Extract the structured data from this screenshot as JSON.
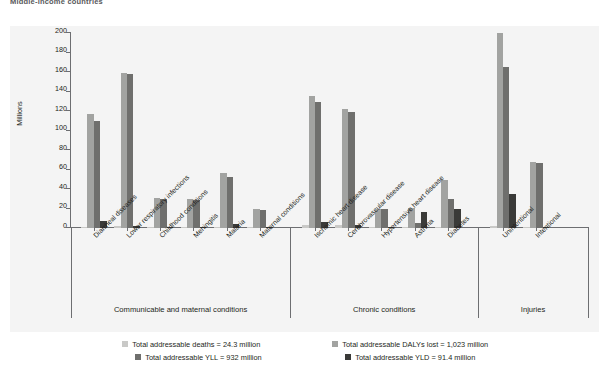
{
  "title": "Middle-income countries",
  "axis": {
    "y_label": "Millions",
    "y_ticks": [
      "200",
      "180",
      "160",
      "140",
      "120",
      "100",
      "80",
      "60",
      "40",
      "20",
      "0"
    ]
  },
  "legend": {
    "items": [
      {
        "label": "Total addressable deaths = 24.3 million",
        "color": "#c9c9c7",
        "key": "deaths"
      },
      {
        "label": "Total addressable DALYs lost = 1,023 million",
        "color": "#a2a3a1",
        "key": "dalys"
      },
      {
        "label": "Total addressable YLL = 932 million",
        "color": "#6f6f6d",
        "key": "yll"
      },
      {
        "label": "Total addressable YLD = 91.4 million",
        "color": "#3a3a38",
        "key": "yld"
      }
    ]
  },
  "groups": [
    {
      "name": "Communicable and maternal conditions"
    },
    {
      "name": "Chronic conditions"
    },
    {
      "name": "Injuries"
    }
  ],
  "chart_data": {
    "type": "bar",
    "title": "Middle-income countries",
    "xlabel": "",
    "ylabel": "Millions",
    "ylim": [
      0,
      200
    ],
    "ytick_step": 20,
    "grid": false,
    "legend_position": "bottom",
    "categories": [
      "Diarrheal diseases",
      "Lower respiratory infections",
      "Childhood conditions",
      "Meningitis",
      "Malaria",
      "Maternal conditions",
      "Ischemic heart disease",
      "Cerebrovascular disease",
      "Hypertensive heart disease",
      "Asthma",
      "Diabetes",
      "Unintentional",
      "Intentional"
    ],
    "category_groups": [
      "Communicable and maternal conditions",
      "Communicable and maternal conditions",
      "Communicable and maternal conditions",
      "Communicable and maternal conditions",
      "Communicable and maternal conditions",
      "Communicable and maternal conditions",
      "Chronic conditions",
      "Chronic conditions",
      "Chronic conditions",
      "Chronic conditions",
      "Chronic conditions",
      "Injuries",
      "Injuries"
    ],
    "series": [
      {
        "name": "Total addressable deaths",
        "color": "#c9c9c7",
        "values": [
          1.5,
          1.8,
          0.6,
          0.5,
          0.6,
          0.4,
          3.5,
          3.2,
          0.6,
          0.3,
          0.6,
          2.0,
          1.0
        ]
      },
      {
        "name": "Total addressable DALYs lost",
        "color": "#a2a3a1",
        "values": [
          117,
          159,
          31,
          30,
          56,
          19,
          135,
          122,
          20,
          21,
          49,
          200,
          68
        ]
      },
      {
        "name": "Total addressable YLL",
        "color": "#6f6f6d",
        "values": [
          110,
          158,
          30,
          29,
          52,
          18,
          129,
          119,
          19,
          5,
          30,
          165,
          67
        ]
      },
      {
        "name": "Total addressable YLD",
        "color": "#3a3a38",
        "values": [
          7,
          2,
          1,
          1.5,
          4,
          1,
          6,
          3,
          1,
          16,
          19,
          35,
          1
        ]
      }
    ],
    "totals": {
      "addressable_deaths_million": 24.3,
      "addressable_dalys_lost_million": 1023,
      "addressable_yll_million": 932,
      "addressable_yld_million": 91.4
    }
  }
}
